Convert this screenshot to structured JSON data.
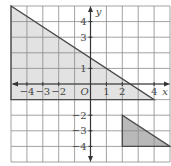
{
  "diagram": {
    "type": "coordinate-plane",
    "x_axis": {
      "label": "x",
      "range": [
        -5,
        5
      ],
      "tick_labels": [
        "-4",
        "-3",
        "-2",
        "1",
        "2",
        "4"
      ],
      "tick_values": [
        -4,
        -3,
        -2,
        1,
        2,
        4
      ]
    },
    "y_axis": {
      "label": "y",
      "range": [
        -5,
        5
      ],
      "tick_labels": [
        "4",
        "3",
        "1",
        "-2",
        "-3",
        "-4"
      ],
      "tick_values": [
        4,
        3,
        1,
        -2,
        -3,
        -4
      ]
    },
    "origin_label": "O",
    "grid": {
      "step": 1,
      "color": "#8a8a8a"
    },
    "shapes": [
      {
        "name": "large-triangle",
        "vertices": [
          [
            -5,
            5
          ],
          [
            -5,
            -1
          ],
          [
            4,
            -1
          ]
        ],
        "fill": "#e2e2e2",
        "stroke": "#4a4a4a"
      },
      {
        "name": "small-triangle",
        "vertices": [
          [
            2,
            -2
          ],
          [
            2,
            -4
          ],
          [
            5,
            -4
          ]
        ],
        "fill": "#b9b9b9",
        "stroke": "#4a4a4a"
      }
    ],
    "colors": {
      "axis": "#333333",
      "text": "#444444"
    }
  }
}
